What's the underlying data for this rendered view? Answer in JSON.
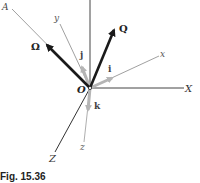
{
  "figure": {
    "caption": "Fig. 15.36"
  },
  "labels": {
    "A": "A",
    "y": "y",
    "Omega": "Ω",
    "j": "j",
    "Q": "Q",
    "i": "i",
    "x": "x",
    "O": "O",
    "X": "X",
    "k": "k",
    "z": "z",
    "Z": "Z"
  },
  "colors": {
    "fixed_axes": "#333333",
    "moving_axes": "#999999",
    "unit_vectors": "#b5b5b5",
    "vectors": "#1a1a1a"
  }
}
